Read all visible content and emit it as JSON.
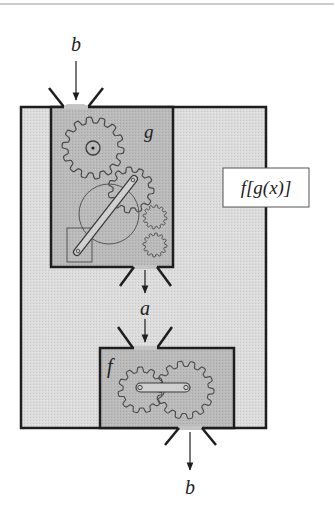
{
  "diagram": {
    "composition_label": "f[g(x)]",
    "labels": {
      "input": "b",
      "intermediate": "a",
      "output": "b",
      "inner_machine": "g",
      "outer_machine": "f"
    },
    "colors": {
      "outer_fill": "#d9d9d9",
      "machine_fill": "#b8b8b8",
      "stroke": "#1e1e1e",
      "gear_stroke": "#4a4a4a",
      "label_box_fill": "#ffffff",
      "funnel_fill": "#c4c4c4"
    },
    "components": [
      {
        "name": "outer-box",
        "represents": "f[g(x)] composite"
      },
      {
        "name": "g-machine",
        "gears": 4,
        "label": "g"
      },
      {
        "name": "f-machine",
        "gears": 2,
        "label": "f"
      }
    ],
    "flow": [
      "b",
      "g",
      "a",
      "f",
      "b"
    ]
  }
}
